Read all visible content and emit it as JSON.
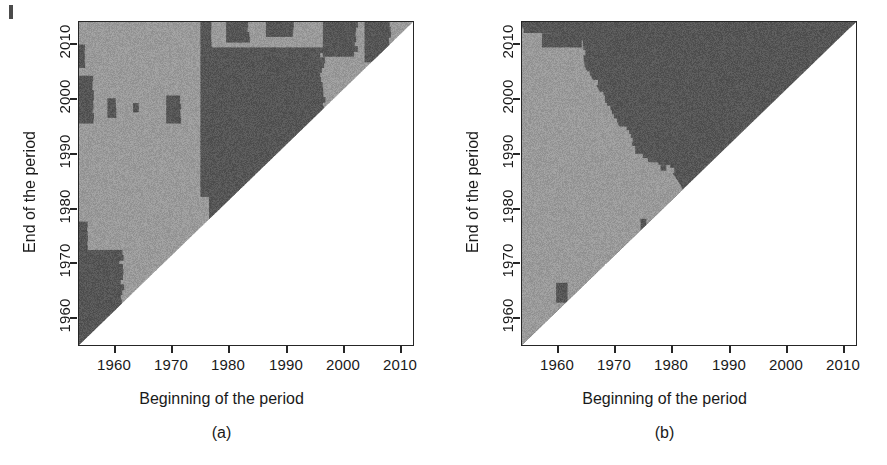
{
  "figure": {
    "background_color": "#ffffff",
    "axis_color": "#262626",
    "light_gray": "#9a9a9a",
    "dark_gray": "#565656",
    "blank_color": "#ffffff"
  },
  "panels": [
    {
      "id": "a",
      "caption": "(a)",
      "xlabel": "Beginning of the period",
      "ylabel": "End of the period",
      "xticks": [
        "1960",
        "1970",
        "1980",
        "1990",
        "2000",
        "2010"
      ],
      "yticks": [
        "1960",
        "1970",
        "1980",
        "1990",
        "2000",
        "2010"
      ]
    },
    {
      "id": "b",
      "caption": "(b)",
      "xlabel": "Beginning of the period",
      "ylabel": "End of the period",
      "xticks": [
        "1960",
        "1970",
        "1980",
        "1990",
        "2000",
        "2010"
      ],
      "yticks": [
        "1960",
        "1970",
        "1980",
        "1990",
        "2000",
        "2010"
      ]
    }
  ],
  "chart_data": [
    {
      "type": "heatmap",
      "panel": "a",
      "title": "(a)",
      "xlabel": "Beginning of the period",
      "ylabel": "End of the period",
      "xlim": [
        1953,
        2012
      ],
      "ylim": [
        1958.5,
        2016
      ],
      "xticks": [
        1960,
        1970,
        1980,
        1990,
        2000,
        2010
      ],
      "yticks": [
        1960,
        1970,
        1980,
        1990,
        2000,
        2010
      ],
      "grid": false,
      "legend": "none",
      "categories": [
        "blank (end <= beginning)",
        "light gray",
        "dark gray"
      ],
      "colors": [
        "#ffffff",
        "#9a9a9a",
        "#565656"
      ],
      "note": "Upper-triangular raster of period start (x) vs period end (y); cells below the diagonal are blank/white.",
      "dark_regions": [
        {
          "x_range": [
            1953.0,
            1960.5
          ],
          "y_range": [
            1958.5,
            1975.5
          ],
          "label": "lower-left dark block"
        },
        {
          "x_range": [
            1953.0,
            1954.5
          ],
          "y_range": [
            1975.5,
            1980.5
          ],
          "label": "left edge dark sliver"
        },
        {
          "x_range": [
            1953.0,
            1955.5
          ],
          "y_range": [
            1998.0,
            2006.5
          ],
          "label": "left edge dark patch"
        },
        {
          "x_range": [
            1953.0,
            1954.0
          ],
          "y_range": [
            2008.0,
            2012.0
          ],
          "label": "left edge dark speck"
        },
        {
          "x_range": [
            1958.0,
            1959.5
          ],
          "y_range": [
            1999.0,
            2002.5
          ],
          "label": "small dark speck"
        },
        {
          "x_range": [
            1962.5,
            1963.5
          ],
          "y_range": [
            2000.0,
            2001.5
          ],
          "label": "small dark speck"
        },
        {
          "x_range": [
            1968.5,
            1971.0
          ],
          "y_range": [
            1998.0,
            2003.0
          ],
          "label": "dark speck cluster"
        },
        {
          "x_range": [
            1974.5,
            1976.5
          ],
          "y_range": [
            1985.0,
            2016.0
          ],
          "label": "vertical dark band at 1975"
        },
        {
          "x_range": [
            1976.0,
            1996.0
          ],
          "y_range": [
            1987.0,
            2011.5
          ],
          "label": "main dark block 1976-1996"
        },
        {
          "x_range": [
            1976.0,
            1986.0
          ],
          "y_range": [
            1981.0,
            1987.0
          ],
          "label": "dark extension below main block"
        },
        {
          "x_range": [
            1996.0,
            2002.0
          ],
          "y_range": [
            2010.0,
            2016.0
          ],
          "label": "upper dark patch near 2000"
        },
        {
          "x_range": [
            2003.5,
            2008.0
          ],
          "y_range": [
            2009.0,
            2016.0
          ],
          "label": "upper right dark patch"
        },
        {
          "x_range": [
            1979.0,
            1983.0
          ],
          "y_range": [
            2012.5,
            2016.0
          ],
          "label": "top dark speck"
        },
        {
          "x_range": [
            1986.0,
            1991.0
          ],
          "y_range": [
            2013.5,
            2016.0
          ],
          "label": "top dark speck"
        }
      ],
      "light_regions": [
        {
          "x_range": [
            1953.0,
            1975.0
          ],
          "y_range": [
            1975.0,
            2016.0
          ],
          "label": "large light region left"
        },
        {
          "x_range": [
            1996.0,
            2012.0
          ],
          "y_range": [
            1996.0,
            2016.0
          ],
          "label": "light region upper right"
        }
      ]
    },
    {
      "type": "heatmap",
      "panel": "b",
      "title": "(b)",
      "xlabel": "Beginning of the period",
      "ylabel": "End of the period",
      "xlim": [
        1953,
        2012
      ],
      "ylim": [
        1958.5,
        2016
      ],
      "xticks": [
        1960,
        1970,
        1980,
        1990,
        2000,
        2010
      ],
      "yticks": [
        1960,
        1970,
        1980,
        1990,
        2000,
        2010
      ],
      "grid": false,
      "legend": "none",
      "categories": [
        "blank (end <= beginning)",
        "light gray",
        "dark gray"
      ],
      "colors": [
        "#ffffff",
        "#9a9a9a",
        "#565656"
      ],
      "note": "Large dark-gray region to the right of a ragged descending boundary; light-gray region to the left.",
      "boundary_points": [
        {
          "x": 1953.0,
          "y": 2016.0
        },
        {
          "x": 1953.0,
          "y": 2014.0
        },
        {
          "x": 1957.0,
          "y": 2014.0
        },
        {
          "x": 1960.0,
          "y": 2013.0
        },
        {
          "x": 1963.5,
          "y": 2012.5
        },
        {
          "x": 1964.0,
          "y": 2008.0
        },
        {
          "x": 1966.0,
          "y": 2005.0
        },
        {
          "x": 1968.0,
          "y": 2001.0
        },
        {
          "x": 1969.5,
          "y": 1998.0
        },
        {
          "x": 1972.0,
          "y": 1996.0
        },
        {
          "x": 1973.0,
          "y": 1992.5
        },
        {
          "x": 1975.5,
          "y": 1991.0
        },
        {
          "x": 1979.0,
          "y": 1990.0
        },
        {
          "x": 1981.0,
          "y": 1987.0
        },
        {
          "x": 1982.5,
          "y": 1984.0
        }
      ],
      "dark_regions": [
        {
          "x_range": [
            1953.0,
            2012.0
          ],
          "y_range": [
            2015.0,
            2016.0
          ],
          "label": "thin dark strip along top"
        },
        {
          "x_range": [
            1956.5,
            1963.5
          ],
          "y_range": [
            2011.5,
            2014.0
          ],
          "label": "dark speck row near top-left"
        },
        {
          "x_range": [
            1959.0,
            1961.0
          ],
          "y_range": [
            1966.0,
            1969.5
          ],
          "label": "small dark patch near 1960/1968"
        },
        {
          "x_range": [
            1974.0,
            1975.0
          ],
          "y_range": [
            1979.0,
            1981.0
          ],
          "label": "dark speck"
        },
        {
          "x_range": [
            1977.5,
            1978.5
          ],
          "y_range": [
            1989.5,
            1990.5
          ],
          "label": "dark speck"
        },
        {
          "x_range": [
            1980.0,
            1981.0
          ],
          "y_range": [
            1989.5,
            1990.5
          ],
          "label": "dark speck"
        }
      ],
      "light_regions": [
        {
          "x_range": [
            1953.0,
            1982.0
          ],
          "y_range": [
            1958.5,
            2013.0
          ],
          "label": "light-gray lower-left region"
        }
      ]
    }
  ]
}
